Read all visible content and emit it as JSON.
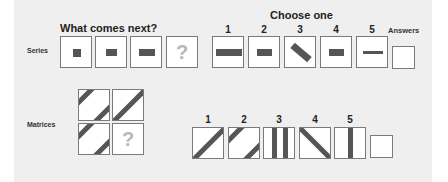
{
  "series": {
    "row_label": "Series",
    "heading": "What comes next?",
    "question_mark": "?",
    "items": [
      {
        "shape": "square",
        "w": 8,
        "h": 8
      },
      {
        "shape": "rect",
        "w": 11,
        "h": 7
      },
      {
        "shape": "rect",
        "w": 16,
        "h": 7
      },
      {
        "shape": "question"
      }
    ],
    "choose_heading": "Choose one",
    "choices": [
      {
        "number": "1",
        "shape": "rect",
        "w": 26,
        "h": 7,
        "angle": 0
      },
      {
        "number": "2",
        "shape": "rect",
        "w": 15,
        "h": 7,
        "angle": 0
      },
      {
        "number": "3",
        "shape": "rect",
        "w": 22,
        "h": 7,
        "angle": 40
      },
      {
        "number": "4",
        "shape": "rect",
        "w": 15,
        "h": 7,
        "angle": 0
      },
      {
        "number": "5",
        "shape": "rect",
        "w": 20,
        "h": 3,
        "angle": 0
      }
    ],
    "answers_label": "Answers"
  },
  "matrices": {
    "row_label": "Matrices",
    "question_mark": "?",
    "cells": [
      {
        "pattern": "two-diagonals"
      },
      {
        "pattern": "one-diagonal"
      },
      {
        "pattern": "two-diagonals"
      },
      {
        "pattern": "question"
      }
    ],
    "choices": [
      {
        "number": "1",
        "pattern": "one-diagonal"
      },
      {
        "number": "2",
        "pattern": "two-diagonals"
      },
      {
        "number": "3",
        "pattern": "two-verticals"
      },
      {
        "number": "4",
        "pattern": "back-diagonal"
      },
      {
        "number": "5",
        "pattern": "one-vertical"
      }
    ]
  },
  "colors": {
    "panel_bg": "#efefef",
    "shape_fill": "#555555",
    "box_border": "#7a7a7a",
    "question_mark": "#b8b8b8"
  }
}
